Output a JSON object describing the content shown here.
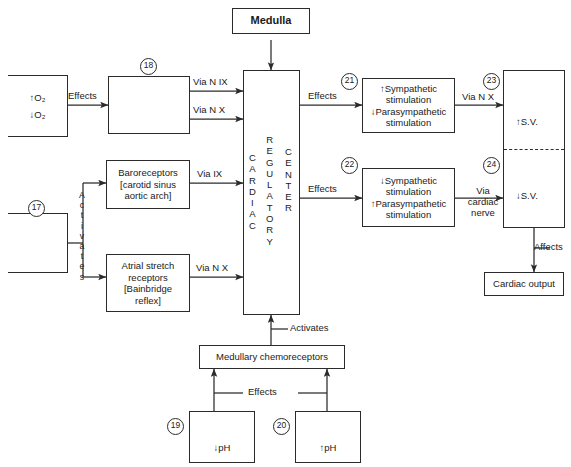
{
  "diagram": {
    "colors": {
      "line": "#2b2b2b",
      "background": "#ffffff",
      "text": "#1a1a1a"
    }
  },
  "nodes": {
    "medulla": {
      "label": "Medulla"
    },
    "o2_box": {
      "line1": "↑O₂",
      "line2": "↓O₂"
    },
    "box18": {
      "label": "",
      "number": "18"
    },
    "box17": {
      "label": "",
      "number": "17"
    },
    "baroreceptors": {
      "line1": "Baroreceptors",
      "line2": "[carotid sinus",
      "line3": "aortic arch]"
    },
    "atrial_stretch": {
      "line1": "Atrial stretch",
      "line2": "receptors",
      "line3": "[Bainbridge",
      "line4": "reflex]"
    },
    "cardiac_center": {
      "col1": "CARDIAC",
      "col2": "REGULATORY",
      "col3": "CENTER"
    },
    "box21": {
      "number": "21",
      "line1": "↑Sympathetic",
      "line2": "stimulation",
      "line3": "↓Parasympathetic",
      "line4": "stimulation"
    },
    "box22": {
      "number": "22",
      "line1": "↓Sympathetic",
      "line2": "stimulation",
      "line3": "↑Parasympathetic",
      "line4": "stimulation"
    },
    "sv_upper": {
      "number": "23",
      "label": "↑S.V."
    },
    "sv_lower": {
      "number": "24",
      "label": "↓S.V."
    },
    "cardiac_output": {
      "label": "Cardiac output"
    },
    "medullary_chemoreceptors": {
      "label": "Medullary chemoreceptors"
    },
    "box19": {
      "number": "19",
      "label": "↓pH"
    },
    "box20": {
      "number": "20",
      "label": "↑pH"
    }
  },
  "edges": {
    "effects_o2": "Effects",
    "via_n_ix": "Via N IX",
    "via_n_x_top": "Via N X",
    "activates_left": "Activates",
    "via_ix": "Via  IX",
    "via_n_x_atrial": "Via  N X",
    "effects_21": "Effects",
    "effects_22": "Effects",
    "via_n_x_sv": "Via N X",
    "via_cardiac_nerve_l1": "Via",
    "via_cardiac_nerve_l2": "cardiac",
    "via_cardiac_nerve_l3": "nerve",
    "affects": "Affects",
    "activates_bottom": "Activates",
    "effects_bottom": "Effects"
  }
}
